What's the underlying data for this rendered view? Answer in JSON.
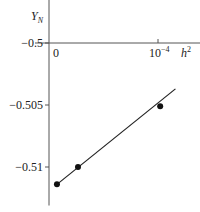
{
  "chart_data": {
    "type": "scatter",
    "title": "",
    "xlabel": "h",
    "xlabel_sup": "2",
    "ylabel": "Y",
    "ylabel_sub": "N",
    "xlim": [
      0,
      0.000128
    ],
    "ylim": [
      -0.5123,
      -0.4965
    ],
    "x_ticks": [
      {
        "value": 0,
        "label": "0"
      },
      {
        "value": 0.0001,
        "label": "10",
        "sup": "−4"
      }
    ],
    "y_ticks": [
      {
        "value": -0.5,
        "label": "−0.5"
      },
      {
        "value": -0.505,
        "label": "−0.505"
      },
      {
        "value": -0.51,
        "label": "−0.51"
      }
    ],
    "series": [
      {
        "name": "data points",
        "points": [
          {
            "x": 7.3e-06,
            "y": -0.5114
          },
          {
            "x": 2.66e-05,
            "y": -0.51
          },
          {
            "x": 0.000102,
            "y": -0.5051
          }
        ]
      },
      {
        "name": "fit line",
        "line": [
          {
            "x": 7.3e-06,
            "y": -0.5114
          },
          {
            "x": 0.000116,
            "y": -0.5037
          }
        ]
      }
    ],
    "grid": false,
    "legend": "none"
  }
}
